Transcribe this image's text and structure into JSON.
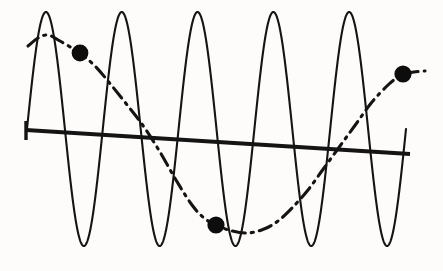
{
  "figure": {
    "name": "oscillation-envelope-plot",
    "background_color": "#fdfcfb",
    "ink_color": "#141414",
    "width": 443,
    "height": 271
  },
  "chart_data": {
    "type": "line",
    "title": "",
    "subtitle": "",
    "xlabel": "",
    "ylabel": "",
    "xlim": [
      0,
      443
    ],
    "ylim": [
      271,
      0
    ],
    "grid": false,
    "legend": null,
    "axes_visible": false,
    "tick_labels": {
      "x": [],
      "y": []
    },
    "annotations": [],
    "series": [
      {
        "name": "carrier-oscillation",
        "style": "solid",
        "stroke_width": 2.1,
        "color": "#141414",
        "description": "high-frequency sine, 5 cycles, large amplitude, truncated at right edge",
        "x_start": 27,
        "x_end": 406,
        "baseline_y": 129,
        "amplitude": 117,
        "cycles": 5,
        "phase_deg": 0,
        "peak_x": [
          97,
          180,
          258,
          327,
          400
        ],
        "peak_y": [
          12,
          12,
          12,
          12,
          12
        ],
        "trough_x": [
          38,
          122,
          205,
          277,
          352
        ],
        "trough_y": [
          246,
          246,
          246,
          246,
          246
        ],
        "end_point": [
          406,
          135
        ]
      },
      {
        "name": "modulating-envelope",
        "style": "dash-dot",
        "stroke_width": 3.1,
        "color": "#141414",
        "description": "slow cosine-like envelope, one full trough between start and end",
        "x_start": 28,
        "x_end": 425,
        "points": [
          [
            28,
            46
          ],
          [
            38,
            38
          ],
          [
            48,
            35
          ],
          [
            60,
            41
          ],
          [
            72,
            48
          ],
          [
            80,
            53
          ],
          [
            96,
            67
          ],
          [
            112,
            86
          ],
          [
            128,
            106
          ],
          [
            144,
            127
          ],
          [
            160,
            152
          ],
          [
            176,
            180
          ],
          [
            192,
            205
          ],
          [
            204,
            218
          ],
          [
            216,
            225
          ],
          [
            232,
            231
          ],
          [
            248,
            233
          ],
          [
            264,
            229
          ],
          [
            278,
            221
          ],
          [
            292,
            208
          ],
          [
            308,
            190
          ],
          [
            324,
            168
          ],
          [
            340,
            146
          ],
          [
            356,
            124
          ],
          [
            372,
            102
          ],
          [
            388,
            85
          ],
          [
            398,
            77
          ],
          [
            403,
            74
          ],
          [
            414,
            72
          ],
          [
            425,
            71
          ]
        ]
      },
      {
        "name": "trend-line",
        "style": "solid-thick",
        "stroke_width": 4.2,
        "color": "#141414",
        "description": "near-horizontal baseline sloping gently downward to the right",
        "points": [
          [
            26,
            130
          ],
          [
            410,
            154
          ]
        ],
        "has_left_tick": true,
        "left_tick": [
          [
            26,
            121
          ],
          [
            26,
            140
          ]
        ]
      }
    ],
    "markers": [
      {
        "name": "marker-left",
        "x": 80,
        "y": 53,
        "radius": 8.4,
        "shape": "circle",
        "color": "#0d0d0d",
        "on_series": "modulating-envelope"
      },
      {
        "name": "marker-bottom",
        "x": 216,
        "y": 225,
        "radius": 8.6,
        "shape": "circle",
        "color": "#0d0d0d",
        "on_series": "modulating-envelope"
      },
      {
        "name": "marker-right",
        "x": 403,
        "y": 74,
        "radius": 8.6,
        "shape": "circle",
        "color": "#0d0d0d",
        "on_series": "modulating-envelope"
      }
    ]
  }
}
